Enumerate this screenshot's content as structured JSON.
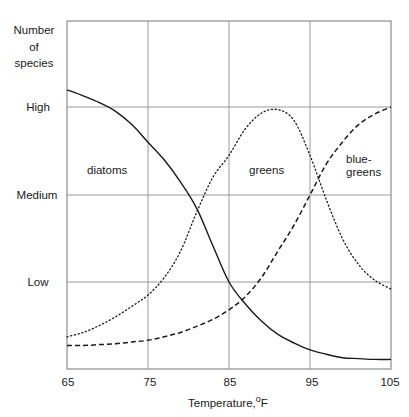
{
  "chart_data": {
    "type": "line",
    "title": "",
    "xlabel": "Temperature, °F",
    "xlabel_main": "Temperature,",
    "xlabel_unit_sup": "o",
    "xlabel_unit": "F",
    "ylabel_lines": [
      "Number",
      "of",
      "species"
    ],
    "ylabel": "Number of species",
    "x_ticks": [
      "65",
      "75",
      "85",
      "95",
      "105"
    ],
    "xlim": [
      65,
      105
    ],
    "y_ticks": [
      "Low",
      "Medium",
      "High"
    ],
    "y_levels": {
      "Low": 1,
      "Medium": 2,
      "High": 3
    },
    "ylim": [
      0,
      4
    ],
    "grid": true,
    "legend": "inline labels",
    "series": [
      {
        "name": "diatoms",
        "style": "solid",
        "label": "diatoms",
        "x": [
          65,
          67,
          69,
          71,
          73,
          75,
          77,
          79,
          81,
          83,
          85,
          87,
          89,
          91,
          93,
          95,
          97,
          99,
          101,
          103,
          105
        ],
        "y": [
          3.2,
          3.13,
          3.05,
          2.95,
          2.8,
          2.6,
          2.4,
          2.15,
          1.85,
          1.42,
          1.0,
          0.75,
          0.55,
          0.4,
          0.3,
          0.22,
          0.17,
          0.13,
          0.12,
          0.11,
          0.11
        ]
      },
      {
        "name": "greens",
        "style": "dotted",
        "label": "greens",
        "x": [
          65,
          67,
          69,
          71,
          73,
          75,
          77,
          79,
          81,
          83,
          85,
          87,
          89,
          91,
          93,
          95,
          97,
          99,
          101,
          103,
          105
        ],
        "y": [
          0.37,
          0.42,
          0.5,
          0.6,
          0.72,
          0.85,
          1.05,
          1.35,
          1.8,
          2.2,
          2.45,
          2.75,
          2.93,
          2.97,
          2.85,
          2.45,
          1.95,
          1.5,
          1.2,
          1.02,
          0.92
        ]
      },
      {
        "name": "blue-greens",
        "style": "dashed",
        "label": "blue-\ngreens",
        "x": [
          65,
          67,
          69,
          71,
          73,
          75,
          77,
          79,
          81,
          83,
          85,
          87,
          89,
          91,
          93,
          95,
          97,
          99,
          101,
          103,
          105
        ],
        "y": [
          0.27,
          0.27,
          0.28,
          0.29,
          0.31,
          0.33,
          0.37,
          0.42,
          0.49,
          0.57,
          0.68,
          0.83,
          1.05,
          1.35,
          1.65,
          2.0,
          2.35,
          2.6,
          2.8,
          2.92,
          3.0
        ]
      }
    ],
    "annotations": [
      {
        "text": "diatoms",
        "x": 69.5,
        "y": 2.35
      },
      {
        "text": "greens",
        "x": 88.5,
        "y": 2.35
      },
      {
        "text": "blue-greens",
        "x": 98.5,
        "y": 2.4
      }
    ]
  }
}
